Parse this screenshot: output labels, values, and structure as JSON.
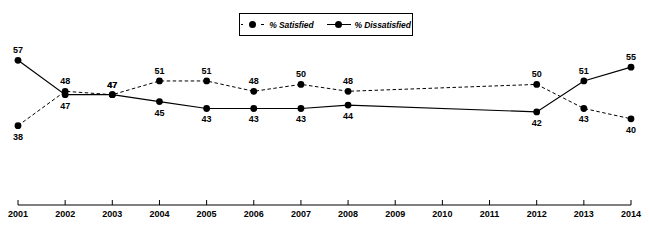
{
  "legend": {
    "position": "top-center",
    "entries": [
      {
        "label": "% Satisfied",
        "style": "dashed",
        "marker": "circle",
        "color": "#000000"
      },
      {
        "label": "% Dissatisfied",
        "style": "solid",
        "marker": "circle",
        "color": "#000000"
      }
    ]
  },
  "chart_data": {
    "type": "line",
    "title": "",
    "subtitle": "",
    "xlabel": "",
    "ylabel": "",
    "grid": false,
    "legend_position": "top-center",
    "ylim": [
      35,
      60
    ],
    "categories": [
      "2001",
      "2002",
      "2003",
      "2004",
      "2005",
      "2006",
      "2007",
      "2008",
      "2009",
      "2010",
      "2011",
      "2012",
      "2013",
      "2014"
    ],
    "series": [
      {
        "name": "% Satisfied",
        "style": "dashed",
        "color": "#000000",
        "values": [
          38,
          48,
          47,
          51,
          51,
          48,
          50,
          48,
          null,
          null,
          null,
          50,
          43,
          40
        ],
        "labels": [
          "38",
          "48",
          "47",
          "51",
          "51",
          "48",
          "50",
          "48",
          "",
          "",
          "",
          "50",
          "43",
          "40"
        ],
        "label_positions": [
          "below",
          "above",
          "above",
          "above",
          "above",
          "above",
          "above",
          "above",
          "",
          "",
          "",
          "above",
          "below",
          "below"
        ]
      },
      {
        "name": "% Dissatisfied",
        "style": "solid",
        "color": "#000000",
        "values": [
          57,
          47,
          47,
          45,
          43,
          43,
          43,
          44,
          null,
          null,
          null,
          42,
          51,
          55
        ],
        "labels": [
          "57",
          "47",
          "47",
          "45",
          "43",
          "43",
          "43",
          "44",
          "",
          "",
          "",
          "42",
          "51",
          "55"
        ],
        "label_positions": [
          "above",
          "below",
          "above",
          "below",
          "below",
          "below",
          "below",
          "below",
          "",
          "",
          "",
          "below",
          "above",
          "above"
        ]
      }
    ],
    "xaxis": {
      "ticks": [
        "2001",
        "2002",
        "2003",
        "2004",
        "2005",
        "2006",
        "2007",
        "2008",
        "2009",
        "2010",
        "2011",
        "2012",
        "2013",
        "2014"
      ],
      "line_color": "#000000"
    }
  }
}
